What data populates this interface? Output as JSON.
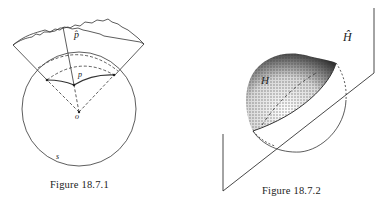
{
  "figures": [
    {
      "caption": "Figure 18.7.1",
      "labels": {
        "p_hat": "p̂",
        "p": "p",
        "o": "o",
        "s": "s"
      },
      "description": "Circle S with center o; point p on an arc region near the top, cone from o through the arc extending to a wavy-edged cap labeled p-hat"
    },
    {
      "caption": "Figure 18.7.2",
      "labels": {
        "H": "H",
        "H_hat": "Ĥ"
      },
      "description": "Sphere cut by an oblique plane; stippled hemisphere cap H above the plane Ĥ"
    }
  ],
  "colors": {
    "ink": "#222222",
    "background": "#ffffff"
  }
}
